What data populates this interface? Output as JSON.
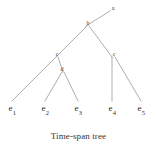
{
  "figure": {
    "caption": "Time-span tree",
    "background_color": "#ffffff",
    "line_color": "#8a8a8a",
    "text_color": "#2b2b2b"
  },
  "tree": {
    "internal_nodes": [
      {
        "id": "a",
        "label": "a",
        "x": 113,
        "y": 8
      },
      {
        "id": "b",
        "label": "b",
        "x": 88,
        "y": 23
      },
      {
        "id": "c_left",
        "label": "c",
        "x": 57,
        "y": 54
      },
      {
        "id": "c_right",
        "label": "c",
        "x": 114,
        "y": 54
      },
      {
        "id": "d",
        "label": "d",
        "x": 62,
        "y": 69
      }
    ],
    "leaves": [
      {
        "id": "e1",
        "base": "e",
        "sub": "1",
        "x": 12,
        "y": 110
      },
      {
        "id": "e2",
        "base": "e",
        "sub": "2",
        "x": 45,
        "y": 110
      },
      {
        "id": "e3",
        "base": "e",
        "sub": "3",
        "x": 78,
        "y": 110
      },
      {
        "id": "e4",
        "base": "e",
        "sub": "4",
        "x": 112,
        "y": 110
      },
      {
        "id": "e5",
        "base": "e",
        "sub": "5",
        "x": 141,
        "y": 110
      }
    ],
    "edges": [
      {
        "name": "edge-b-a",
        "x1": 86,
        "y1": 26,
        "x2": 110,
        "y2": 11
      },
      {
        "name": "edge-b-c-left",
        "x1": 87,
        "y1": 26,
        "x2": 56,
        "y2": 57
      },
      {
        "name": "edge-b-c-right",
        "x1": 89,
        "y1": 26,
        "x2": 112,
        "y2": 57
      },
      {
        "name": "edge-c-left-e1",
        "x1": 56,
        "y1": 57,
        "x2": 12,
        "y2": 101
      },
      {
        "name": "edge-c-left-d",
        "x1": 58,
        "y1": 57,
        "x2": 63,
        "y2": 72
      },
      {
        "name": "edge-d-e2",
        "x1": 62,
        "y1": 72,
        "x2": 45,
        "y2": 101
      },
      {
        "name": "edge-d-e3",
        "x1": 64,
        "y1": 72,
        "x2": 78,
        "y2": 101
      },
      {
        "name": "edge-c-right-e4",
        "x1": 112,
        "y1": 57,
        "x2": 112,
        "y2": 101
      },
      {
        "name": "edge-c-right-e5",
        "x1": 115,
        "y1": 57,
        "x2": 141,
        "y2": 101
      }
    ]
  }
}
